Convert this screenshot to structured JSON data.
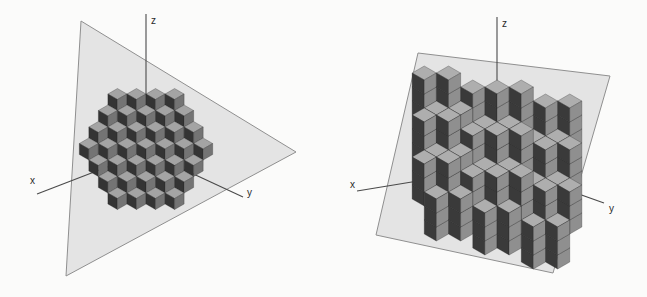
{
  "canvas": {
    "width": 647,
    "height": 297,
    "background": "#fbfbfa"
  },
  "axis_style": {
    "color": "#4a4a4a",
    "width": 1.1,
    "label_color": "#2a2a2a",
    "label_size": 10
  },
  "panels": [
    {
      "id": "left-panel",
      "description": "stepped cube surface approximating a diagonal plane, hexagonal rhombille patch on triangular plane",
      "plane": {
        "shape": "triangle",
        "points": [
          [
            81,
            21
          ],
          [
            296,
            152
          ],
          [
            66,
            276
          ]
        ],
        "fill": "#e4e4e4",
        "stroke": "#8f8f8f"
      },
      "axes": {
        "z": {
          "label": "z",
          "line": [
            [
              146,
              100
            ],
            [
              146,
              14
            ]
          ],
          "label_pos": [
            151,
            24
          ]
        },
        "x": {
          "label": "x",
          "line": [
            [
              146,
              152
            ],
            [
              37,
              194
            ]
          ],
          "label_pos": [
            30,
            184
          ]
        },
        "y": {
          "label": "y",
          "line": [
            [
              146,
              152
            ],
            [
              243,
              197
            ]
          ],
          "label_pos": [
            247,
            196
          ]
        }
      },
      "cubes": {
        "pattern": "diagonal-plane-hexagon",
        "center": [
          146,
          149
        ],
        "cube_size": 11,
        "hex_radius": 3,
        "colors": {
          "top": "#a4a4a4",
          "left": "#343434",
          "right": "#747474",
          "edge": "#222222"
        }
      }
    },
    {
      "id": "right-panel",
      "description": "double-step staircase cube surface on quadrilateral plane",
      "plane": {
        "shape": "quadrilateral",
        "points": [
          [
            418,
            53
          ],
          [
            610,
            76
          ],
          [
            553,
            273
          ],
          [
            376,
            235
          ]
        ],
        "fill": "#e4e4e4",
        "stroke": "#8f8f8f"
      },
      "axes": {
        "z": {
          "label": "z",
          "line": [
            [
              497,
              115
            ],
            [
              497,
              17
            ]
          ],
          "label_pos": [
            502,
            27
          ]
        },
        "x": {
          "label": "x",
          "line": [
            [
              497,
              168
            ],
            [
              357,
              191
            ]
          ],
          "label_pos": [
            350,
            188
          ]
        },
        "y": {
          "label": "y",
          "line": [
            [
              497,
              165
            ],
            [
              604,
              203
            ]
          ],
          "label_pos": [
            609,
            212
          ]
        }
      },
      "cubes": {
        "pattern": "double-step-staircase",
        "origin": [
          497,
          80
        ],
        "cube_size": 14,
        "u_range": [
          -6,
          6
        ],
        "v_range": [
          0,
          5
        ],
        "tower_depth": 2,
        "step_drop": 2,
        "tilt_bands": [
          [
            -6,
            -3,
            1
          ],
          [
            -2,
            2,
            0
          ],
          [
            3,
            6,
            -1
          ]
        ],
        "colors": {
          "top": "#aeaeae",
          "left": "#3a3a3a",
          "right": "#8f8f8f",
          "edge": "#222222"
        }
      }
    }
  ]
}
